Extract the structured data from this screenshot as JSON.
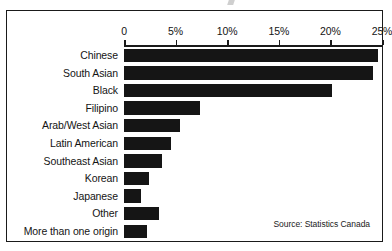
{
  "chart_data": {
    "type": "bar",
    "orientation": "horizontal",
    "title": "",
    "xlabel": "",
    "ylabel": "",
    "xlim": [
      0,
      25
    ],
    "grid": false,
    "legend": null,
    "tick_labels": [
      "0",
      "5%",
      "10%",
      "15%",
      "20%",
      "25%"
    ],
    "tick_values": [
      0,
      5,
      10,
      15,
      20,
      25
    ],
    "categories": [
      "Chinese",
      "South Asian",
      "Black",
      "Filipino",
      "Arab/West Asian",
      "Latin American",
      "Southeast Asian",
      "Korean",
      "Japanese",
      "Other",
      "More than one origin"
    ],
    "values": [
      24.6,
      24.1,
      20.2,
      7.4,
      5.4,
      4.6,
      3.7,
      2.4,
      1.6,
      3.4,
      2.2
    ],
    "source": "Source: Statistics Canada",
    "bar_color": "#151515"
  }
}
